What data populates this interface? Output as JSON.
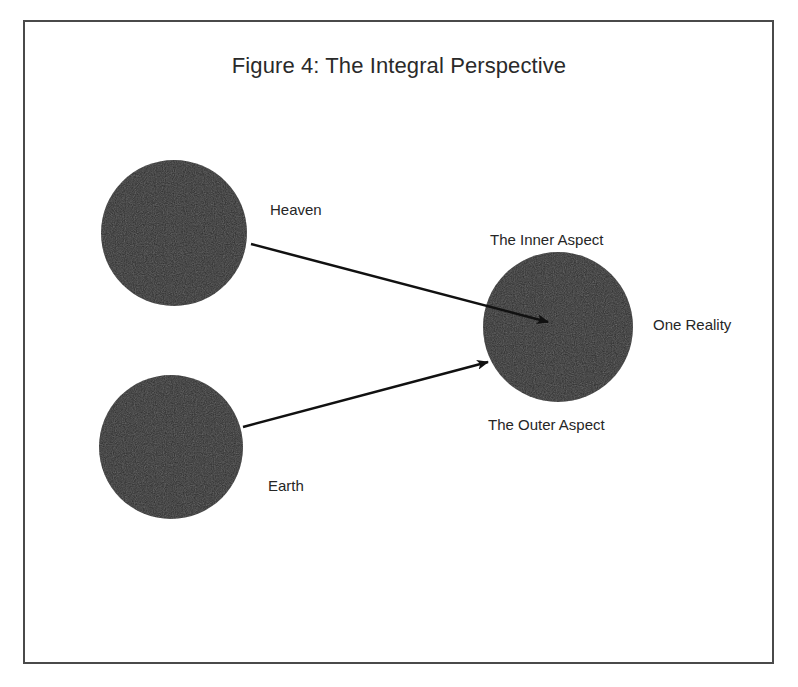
{
  "figure": {
    "title": "Figure 4: The Integral Perspective"
  },
  "nodes": [
    {
      "id": "heaven",
      "label": "Heaven",
      "cx": 174,
      "cy": 233,
      "r": 73
    },
    {
      "id": "earth",
      "label": "Earth",
      "cx": 171,
      "cy": 447,
      "r": 72
    },
    {
      "id": "one-reality",
      "label": "One Reality",
      "cx": 558,
      "cy": 327,
      "r": 75
    }
  ],
  "labels": {
    "heaven": "Heaven",
    "earth": "Earth",
    "inner_aspect": "The Inner Aspect",
    "outer_aspect": "The Outer Aspect",
    "one_reality": "One Reality"
  },
  "edges": [
    {
      "from": "heaven",
      "to": "one-reality",
      "meaning": "The Inner Aspect"
    },
    {
      "from": "earth",
      "to": "one-reality",
      "meaning": "The Outer Aspect"
    }
  ],
  "colors": {
    "circle_fill": "#2e2e2e",
    "arrow": "#111111",
    "border": "#4a4a4a",
    "text": "#262626"
  }
}
